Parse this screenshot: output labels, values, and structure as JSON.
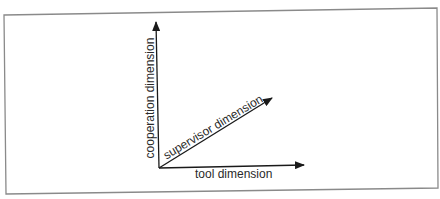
{
  "diagram": {
    "type": "three-axis dimension diagram",
    "axes": [
      {
        "id": "cooperation",
        "label": "cooperation dimension",
        "direction": "vertical"
      },
      {
        "id": "supervisor",
        "label": "supervisor dimension",
        "direction": "diagonal"
      },
      {
        "id": "tool",
        "label": "tool dimension",
        "direction": "horizontal"
      }
    ],
    "colors": {
      "line": "#1a1a1a",
      "border": "#8a8a8a",
      "text": "#2a2a2a",
      "background": "#ffffff"
    }
  }
}
